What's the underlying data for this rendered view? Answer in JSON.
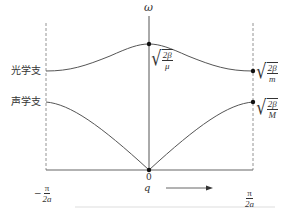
{
  "diagram": {
    "y_axis_label": "ω",
    "x_axis_label": "q",
    "origin_label": "0",
    "left_bound": {
      "sign": "−",
      "num": "π",
      "den": "2a"
    },
    "right_bound": {
      "num": "π",
      "den": "2a"
    },
    "branches": {
      "optical": {
        "label": "光学支"
      },
      "acoustic": {
        "label": "声学支"
      }
    },
    "annotations": {
      "optical_max": {
        "num": "2β",
        "den": "μ"
      },
      "optical_edge": {
        "num": "2β",
        "den": "m"
      },
      "acoustic_edge": {
        "num": "2β",
        "den": "M"
      }
    },
    "colors": {
      "line": "#555555",
      "dashed": "#888888",
      "text": "#333333"
    }
  }
}
